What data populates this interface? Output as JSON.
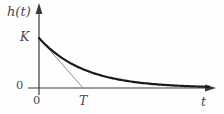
{
  "labels": {
    "y_axis": "h(t)",
    "y_intercept": "K",
    "zero_y": "0",
    "zero_x": "0",
    "tangent_intercept": "T",
    "x_axis": "t"
  },
  "colors": {
    "curve": "#1a1a1a",
    "tangent": "#8f8f8f",
    "axis": "#3a3a3a",
    "text": "#4a4a4a",
    "background": "#fefefe"
  },
  "chart_data": {
    "type": "line",
    "xlabel": "t",
    "ylabel": "h(t)",
    "grid": false,
    "curve": {
      "expression": "h(t) = K * exp(-t / T)",
      "K": 1,
      "T": 1,
      "t_range": [
        0,
        3.8
      ]
    },
    "tangent": {
      "description": "initial-slope tangent line from (0, K) to (T, 0)",
      "from": [
        0,
        1
      ],
      "to": [
        1,
        0
      ]
    },
    "sample_points": {
      "t": [
        0,
        0.5,
        1,
        1.5,
        2,
        2.5,
        3,
        3.5,
        3.8
      ],
      "h": [
        1,
        0.607,
        0.368,
        0.223,
        0.135,
        0.082,
        0.05,
        0.03,
        0.022
      ]
    },
    "annotations": {
      "y_intercept_label": "K",
      "x_intercept_of_tangent_label": "T",
      "origin_labels": [
        "0",
        "0"
      ]
    }
  }
}
